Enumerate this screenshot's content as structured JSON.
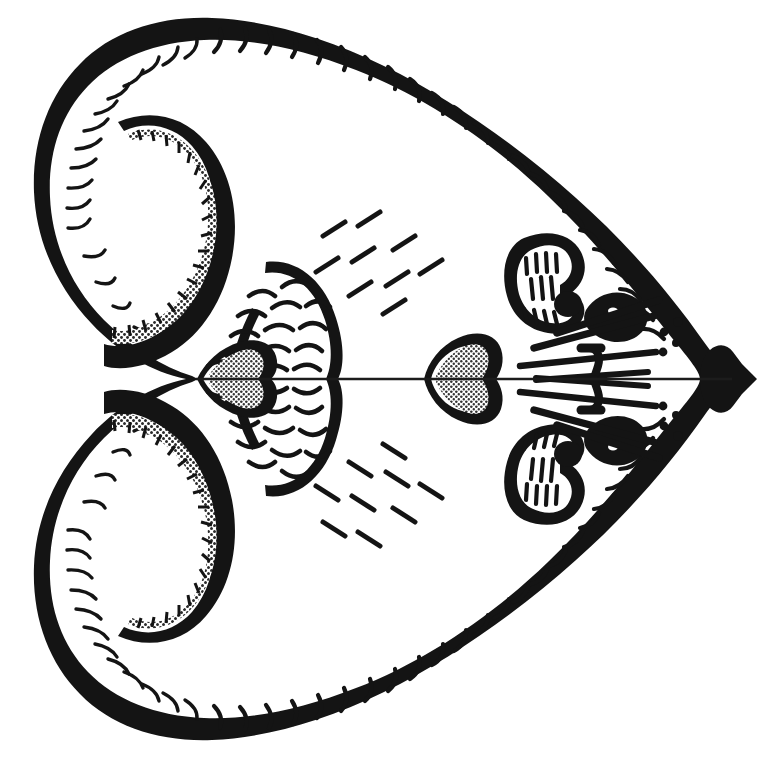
{
  "figure": {
    "domain": "Natural-Image",
    "medium": "pen-and-ink line drawing, halftone stipple shading",
    "background_color": "#ffffff",
    "ink_color": "#141414",
    "stipple_color": "#9a9a9a",
    "canvas": {
      "width": 776,
      "height": 758
    },
    "symmetry": {
      "type": "mirror",
      "axis": "horizontal",
      "axis_y": 379
    }
  },
  "parts": {
    "outline": {
      "name": "head-outline",
      "description": "thick black spade / heart shaped contour, two rounded lobes on the left, tapering to a sharp point on the right",
      "stroke_width_px": 14,
      "fringe": "short inward-curving hairs along the entire inner margin"
    },
    "hook": {
      "name": "ear-hook",
      "description": "thick comma / hook shaped band inside each left lobe, filled with halftone stipple and bordered by small inner tick marks",
      "count": 2,
      "fill": "stipple"
    },
    "fan": {
      "name": "scalloped-fan",
      "description": "teardrop fan just left of the midline covered with rows of nested crescent scallops",
      "count": 2,
      "rows": 8
    },
    "inner_leaf": {
      "name": "inner-nose-leaf",
      "description": "small stippled heart shape on the midline at the base of the scalloped fan",
      "fill": "stipple"
    },
    "outer_leaf": {
      "name": "nose-leaf",
      "description": "larger stippled heart / spear shape on the midline, centre-right of the plate",
      "fill": "stipple"
    },
    "pinna": {
      "name": "ear-pinna",
      "description": "rounded kidney-shaped outline containing vertical striations and a solid black lobe",
      "count": 2
    },
    "eye": {
      "name": "eye",
      "description": "small solid black almond shape with a white catch-light",
      "count": 2
    },
    "whiskers": {
      "name": "whisker-group",
      "description": "long tapering bristles radiating back from the snout, with a vertical cross-bar and small round papillae dots",
      "count_per_side": 4,
      "dot_count_per_side": 4
    },
    "snout_tip": {
      "name": "snout-tip",
      "description": "solid black lobed wedge at the right apex of the outline"
    },
    "fur_dashes": {
      "name": "fur-dash-field",
      "description": "two loose clusters of short slanted dashes suggesting fur texture",
      "clusters": 2,
      "dashes_per_cluster": 9
    },
    "midline": {
      "name": "midline-axis",
      "description": "thin horizontal rule running from the left lobes to the snout tip"
    }
  },
  "caption": {
    "title": "",
    "label": "",
    "note": ""
  }
}
